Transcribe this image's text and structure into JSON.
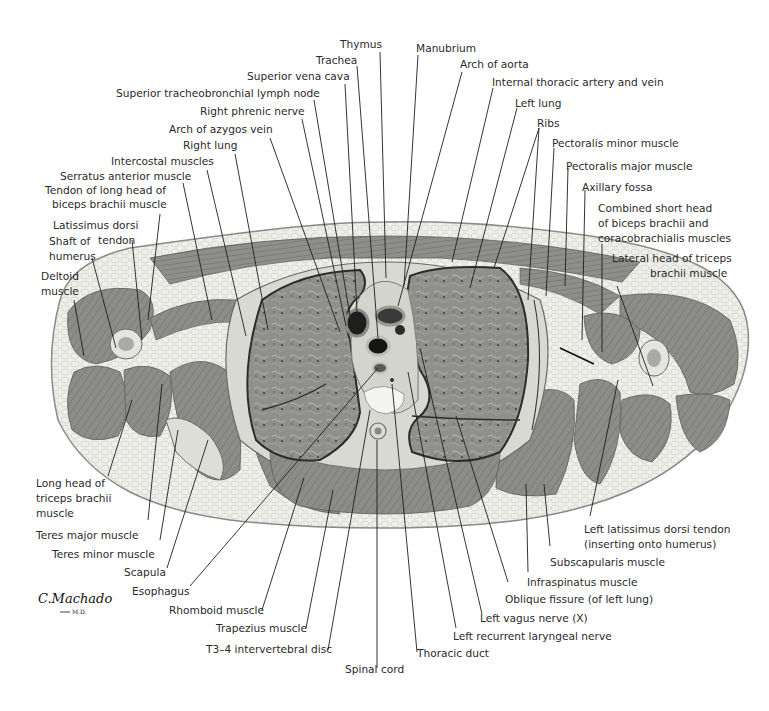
{
  "figure": {
    "signature": "C.Machado",
    "signature_suffix": "M.D.",
    "colors": {
      "background": "#ffffff",
      "skin_fat": "#ecece8",
      "fat_outline": "#9a9a96",
      "muscle": "#8a8a86",
      "muscle_dark": "#6e6e6a",
      "lung": "#8e8e8a",
      "lung_outline": "#2c2c2c",
      "vessel_dark": "#1d1d1d",
      "bone": "#e2e2de",
      "text": "#2a2a2a",
      "leader": "#1e1e1e"
    }
  },
  "labels": {
    "top": [
      {
        "id": "thymus",
        "text": "Thymus"
      },
      {
        "id": "trachea",
        "text": "Trachea"
      },
      {
        "id": "svc",
        "text": "Superior vena cava"
      },
      {
        "id": "stln",
        "text": "Superior tracheobronchial lymph node"
      },
      {
        "id": "rphrenic",
        "text": "Right phrenic nerve"
      },
      {
        "id": "azygos",
        "text": "Arch of azygos vein"
      },
      {
        "id": "rlung",
        "text": "Right lung"
      },
      {
        "id": "intercostal",
        "text": "Intercostal muscles"
      },
      {
        "id": "serratus",
        "text": "Serratus anterior muscle"
      },
      {
        "id": "manubrium",
        "text": "Manubrium"
      },
      {
        "id": "aorta",
        "text": "Arch of aorta"
      },
      {
        "id": "ita",
        "text": "Internal thoracic artery and vein"
      },
      {
        "id": "llung",
        "text": "Left lung"
      },
      {
        "id": "ribs",
        "text": "Ribs"
      },
      {
        "id": "pecminor",
        "text": "Pectoralis minor muscle"
      },
      {
        "id": "pecmajor",
        "text": "Pectoralis major muscle"
      },
      {
        "id": "axfossa",
        "text": "Axillary fossa"
      }
    ],
    "left": [
      {
        "id": "tendonbiceps",
        "lines": [
          "Tendon of long head of",
          "biceps brachii muscle"
        ]
      },
      {
        "id": "latdorsi",
        "lines": [
          "Latissimus dorsi",
          "tendon"
        ]
      },
      {
        "id": "humerus",
        "lines": [
          "Shaft of",
          "humerus"
        ]
      },
      {
        "id": "deltoid",
        "lines": [
          "Deltoid",
          "muscle"
        ]
      },
      {
        "id": "longtriceps",
        "lines": [
          "Long head of",
          "triceps brachii",
          "muscle"
        ]
      },
      {
        "id": "teresmajor",
        "lines": [
          "Teres major muscle"
        ]
      },
      {
        "id": "teresminor",
        "lines": [
          "Teres minor muscle"
        ]
      },
      {
        "id": "scapula",
        "lines": [
          "Scapula"
        ]
      },
      {
        "id": "esophagus",
        "lines": [
          "Esophagus"
        ]
      }
    ],
    "right": [
      {
        "id": "shorthead",
        "lines": [
          "Combined short head",
          "of biceps brachii and",
          "coracobrachialis muscles"
        ]
      },
      {
        "id": "lattriceps",
        "lines": [
          "Lateral head of triceps",
          "brachii muscle"
        ]
      },
      {
        "id": "lldtendon",
        "lines": [
          "Left latissimus dorsi tendon",
          "(inserting onto humerus)"
        ]
      },
      {
        "id": "subscap",
        "lines": [
          "Subscapularis muscle"
        ]
      },
      {
        "id": "infraspin",
        "lines": [
          "Infraspinatus muscle"
        ]
      },
      {
        "id": "oblique",
        "lines": [
          "Oblique fissure (of left lung)"
        ]
      }
    ],
    "bottom": [
      {
        "id": "rhomboid",
        "text": "Rhomboid muscle"
      },
      {
        "id": "trapezius",
        "text": "Trapezius muscle"
      },
      {
        "id": "disc",
        "text": "T3–4 intervertebral disc"
      },
      {
        "id": "spinal",
        "text": "Spinal cord"
      },
      {
        "id": "thoracicduct",
        "text": "Thoracic duct"
      },
      {
        "id": "recurrent",
        "text": "Left recurrent laryngeal nerve"
      },
      {
        "id": "vagus",
        "text": "Left vagus nerve (X)"
      }
    ]
  }
}
